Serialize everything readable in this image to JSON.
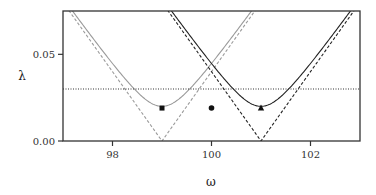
{
  "chart_data": {
    "type": "line",
    "title": "",
    "xlabel": "ω",
    "ylabel": "λ",
    "xlim": [
      97,
      103
    ],
    "ylim": [
      0,
      0.075
    ],
    "xticks": [
      98,
      100,
      102
    ],
    "xtick_labels": [
      "98",
      "100",
      "102"
    ],
    "yticks": [
      0.0,
      0.05
    ],
    "ytick_labels": [
      "0.00",
      "0.05"
    ],
    "grid": false,
    "legend": null,
    "series": [
      {
        "name": "gray-hyperbola",
        "style": "solid",
        "color": "#9a9a9a",
        "center": 99,
        "min": 0.02,
        "slope": 0.04
      },
      {
        "name": "gray-asymptote",
        "style": "dashed",
        "color": "#9a9a9a",
        "center": 99,
        "min": 0,
        "slope": 0.04
      },
      {
        "name": "black-hyperbola",
        "style": "solid",
        "color": "#222222",
        "center": 101,
        "min": 0.02,
        "slope": 0.04
      },
      {
        "name": "black-asymptote",
        "style": "dashed",
        "color": "#222222",
        "center": 101,
        "min": 0,
        "slope": 0.04
      },
      {
        "name": "threshold",
        "style": "dotted",
        "color": "#333333",
        "y": 0.03
      }
    ],
    "markers": [
      {
        "shape": "square",
        "x": 99,
        "y": 0.019
      },
      {
        "shape": "circle",
        "x": 100,
        "y": 0.019
      },
      {
        "shape": "triangle",
        "x": 101,
        "y": 0.019
      }
    ]
  }
}
